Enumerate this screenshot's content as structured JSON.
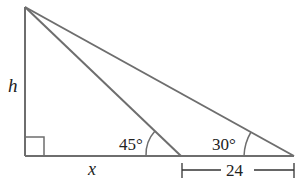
{
  "diagram": {
    "type": "geometry-triangle",
    "labels": {
      "height": "h",
      "base": "x",
      "angle_near": "45°",
      "angle_far": "30°",
      "segment_length": "24"
    },
    "colors": {
      "line": "#6e6e6e",
      "text": "#222222"
    }
  }
}
